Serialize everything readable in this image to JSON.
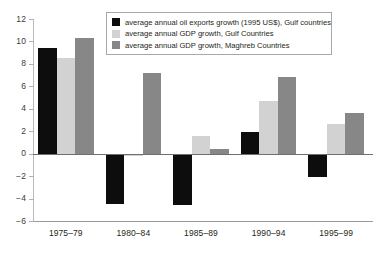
{
  "chart_data": {
    "type": "bar",
    "title": "",
    "xlabel": "",
    "ylabel": "",
    "ylim": [
      -6,
      12
    ],
    "yticks": [
      12,
      10,
      8,
      6,
      4,
      2,
      0,
      -2,
      -4,
      -6
    ],
    "ytick_labels": [
      "12",
      "10",
      "8",
      "6",
      "4",
      "2",
      "0",
      "−2",
      "−4",
      "−6"
    ],
    "grid": false,
    "legend_position": "top-center",
    "categories": [
      "1975–79",
      "1980–84",
      "1985–89",
      "1990–94",
      "1995–99"
    ],
    "series": [
      {
        "name": "average annual oil exports growth (1995 US$), Gulf countries",
        "color": "#0d0d0d",
        "values": [
          9.4,
          -4.5,
          -4.6,
          1.9,
          -2.1
        ]
      },
      {
        "name": "average annual GDP growth, Gulf Countries",
        "color": "#d2d2d2",
        "values": [
          8.5,
          -0.2,
          1.6,
          4.7,
          2.6
        ]
      },
      {
        "name": "average annual GDP growth, Maghreb Countries",
        "color": "#878787",
        "values": [
          10.3,
          7.2,
          0.4,
          6.8,
          3.6
        ]
      }
    ]
  },
  "legend": {
    "items": [
      {
        "label": "average annual oil exports growth (1995 US$), Gulf countries",
        "swatch": "s0"
      },
      {
        "label": "average annual GDP growth, Gulf Countries",
        "swatch": "s1"
      },
      {
        "label": "average annual GDP growth, Maghreb Countries",
        "swatch": "s2"
      }
    ]
  },
  "colors": {
    "series_0": "#0d0d0d",
    "series_1": "#d2d2d2",
    "series_2": "#878787",
    "axis": "#9b9b9b",
    "zero_line": "#6f6f6f",
    "background": "#ffffff"
  }
}
